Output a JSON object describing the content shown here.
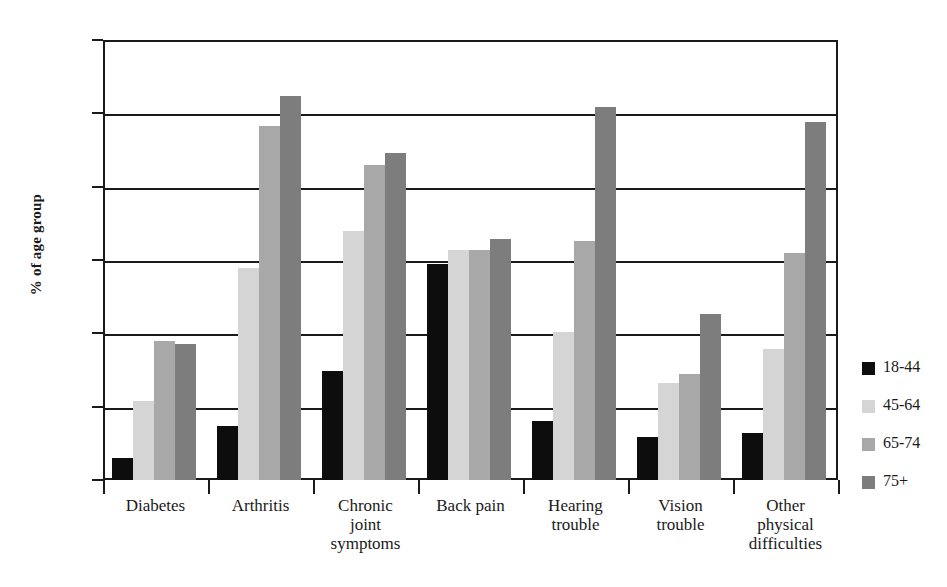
{
  "chart_data": {
    "type": "bar",
    "title": "",
    "xlabel": "",
    "ylabel": "% of age group",
    "ylim": [
      0,
      60
    ],
    "yticks": [
      0,
      10,
      20,
      30,
      40,
      50,
      60
    ],
    "grid": true,
    "legend_position": "right",
    "categories": [
      "Diabetes",
      "Arthritis",
      "Chronic joint symptoms",
      "Back pain",
      "Hearing trouble",
      "Vision trouble",
      "Other physical difficulties"
    ],
    "category_lines": [
      [
        "Diabetes"
      ],
      [
        "Arthritis"
      ],
      [
        "Chronic",
        "joint",
        "symptoms"
      ],
      [
        "Back pain"
      ],
      [
        "Hearing",
        "trouble"
      ],
      [
        "Vision",
        "trouble"
      ],
      [
        "Other",
        "physical",
        "difficulties"
      ]
    ],
    "series": [
      {
        "name": "18-44",
        "color": "#0d0d0d",
        "values": [
          3.0,
          7.4,
          14.8,
          29.4,
          8.1,
          5.9,
          6.4
        ]
      },
      {
        "name": "45-64",
        "color": "#d5d5d5",
        "values": [
          10.8,
          28.9,
          34.0,
          31.4,
          20.2,
          13.2,
          17.8
        ]
      },
      {
        "name": "65-74",
        "color": "#a8a8a8",
        "values": [
          19.0,
          48.3,
          43.0,
          31.4,
          32.6,
          14.4,
          31.0
        ]
      },
      {
        "name": "75+",
        "color": "#7d7d7d",
        "values": [
          18.6,
          52.3,
          44.6,
          32.8,
          50.8,
          22.6,
          48.8
        ]
      }
    ]
  }
}
